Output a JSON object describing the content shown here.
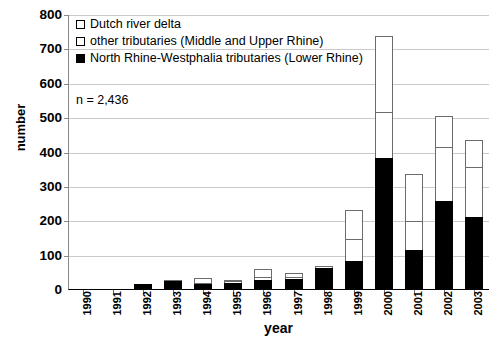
{
  "chart_data": {
    "type": "bar",
    "barmode": "stacked",
    "title": "",
    "xlabel": "year",
    "ylabel": "number",
    "ylim": [
      0,
      800
    ],
    "ytick_step": 100,
    "yticks": [
      0,
      100,
      200,
      300,
      400,
      500,
      600,
      700,
      800
    ],
    "grid": true,
    "grid_axis": "y",
    "legend_position": "top-left inside plot",
    "categories": [
      "1990",
      "1991",
      "1992",
      "1993",
      "1994",
      "1995",
      "1996",
      "1997",
      "1998",
      "1999",
      "2000",
      "2001",
      "2002",
      "2003"
    ],
    "series": [
      {
        "name": "North Rhine-Westphalia tributaries (Lower Rhine)",
        "color": "#000000",
        "fill": "solid-black",
        "values": [
          1,
          2,
          17,
          27,
          18,
          20,
          30,
          32,
          65,
          85,
          383,
          115,
          260,
          212
        ]
      },
      {
        "name": "other tributaries (Middle and Upper Rhine)",
        "color": "#ffffff",
        "fill": "white",
        "values": [
          0,
          0,
          0,
          2,
          5,
          8,
          12,
          10,
          8,
          65,
          137,
          88,
          160,
          150
        ]
      },
      {
        "name": "Dutch river delta",
        "color": "#ffffff",
        "fill": "white",
        "values": [
          0,
          0,
          0,
          2,
          17,
          7,
          25,
          13,
          2,
          90,
          225,
          139,
          92,
          81
        ]
      }
    ],
    "totals": [
      1,
      2,
      17,
      31,
      40,
      35,
      67,
      55,
      75,
      240,
      745,
      342,
      512,
      443
    ],
    "annotations": [
      {
        "text": "n = 2,436"
      }
    ]
  },
  "axes": {
    "y_title": "number",
    "x_title": "year",
    "y_tick_labels": [
      "800",
      "700",
      "600",
      "500",
      "400",
      "300",
      "200",
      "100",
      "0"
    ],
    "x_tick_labels": [
      "1990",
      "1991",
      "1992",
      "1993",
      "1994",
      "1995",
      "1996",
      "1997",
      "1998",
      "1999",
      "2000",
      "2001",
      "2002",
      "2003"
    ]
  },
  "legend": {
    "items": [
      {
        "label": "Dutch river delta",
        "swatch": "white-square"
      },
      {
        "label": "other tributaries (Middle and Upper Rhine)",
        "swatch": "white-square"
      },
      {
        "label": "North Rhine-Westphalia tributaries (Lower Rhine)",
        "swatch": "black-square"
      }
    ]
  },
  "annotation": {
    "sample_size": "n = 2,436"
  },
  "colors": {
    "bar_outline": "#6b6b6b",
    "bar_dark_fill": "#000000",
    "bar_light_fill": "#ffffff",
    "gridline": "#c9c9c9",
    "axis": "#000000",
    "text": "#000000"
  }
}
